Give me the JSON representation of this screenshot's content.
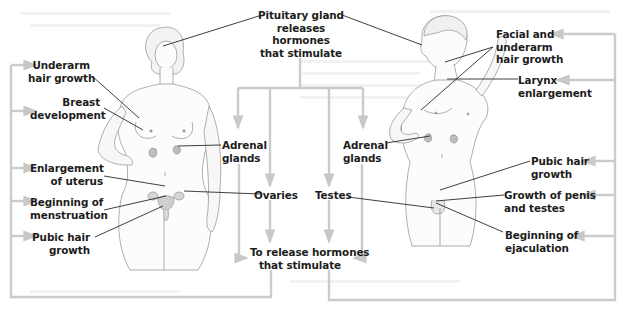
{
  "diagram": {
    "center": {
      "pituitary": [
        "Pituitary gland",
        "releases",
        "hormones",
        "that stimulate"
      ],
      "adrenal_left": [
        "Adrenal",
        "glands"
      ],
      "adrenal_right": [
        "Adrenal",
        "glands"
      ],
      "ovaries": "Ovaries",
      "testes": "Testes",
      "release": [
        "To release hormones",
        "that stimulate"
      ]
    },
    "female": {
      "label": "Female",
      "effects": [
        {
          "id": "underarm",
          "lines": [
            "Underarm",
            "hair growth"
          ]
        },
        {
          "id": "breast",
          "lines": [
            "Breast",
            "development"
          ]
        },
        {
          "id": "uterus",
          "lines": [
            "Enlargement",
            "of uterus"
          ]
        },
        {
          "id": "menstruation",
          "lines": [
            "Beginning of",
            "menstruation"
          ]
        },
        {
          "id": "pubic",
          "lines": [
            "Pubic hair",
            "growth"
          ]
        }
      ]
    },
    "male": {
      "label": "Male",
      "effects": [
        {
          "id": "facial",
          "lines": [
            "Facial and",
            "underarm",
            "hair growth"
          ]
        },
        {
          "id": "larynx",
          "lines": [
            "Larynx",
            "enlargement"
          ]
        },
        {
          "id": "pubic",
          "lines": [
            "Pubic hair",
            "growth"
          ]
        },
        {
          "id": "penis",
          "lines": [
            "Growth of penis",
            "and testes"
          ]
        },
        {
          "id": "ejaculation",
          "lines": [
            "Beginning of",
            "ejaculation"
          ]
        }
      ]
    },
    "colors": {
      "connector_gray": "#c8c8c8",
      "leader_line": "#2a2a2a",
      "text": "#1c1c1c",
      "skin_outline": "#9a9a9a",
      "gland_fill": "#b9b9b9"
    }
  }
}
